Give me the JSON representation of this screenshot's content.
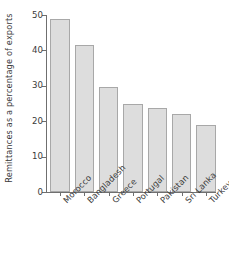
{
  "chart_data": {
    "type": "bar",
    "title": "",
    "subtitle": "",
    "xlabel": "",
    "ylabel": "Remittances as a percentage of exports",
    "categories": [
      "Morocco",
      "Bangladesh",
      "Greece",
      "Portugal",
      "Pakistan",
      "Sri Lanka",
      "Turkey"
    ],
    "values": [
      48.8,
      41.5,
      29.7,
      25.0,
      23.6,
      22.0,
      19.0
    ],
    "ylim": [
      0,
      50
    ],
    "yticks": [
      0,
      10,
      20,
      30,
      40,
      50
    ],
    "ytick_labels": [
      "0",
      "10",
      "20",
      "30",
      "40",
      "50"
    ],
    "grid": false,
    "legend": null,
    "legend_position": "none",
    "bar_fill_color": "#dddddd",
    "bar_edge_color": "#a8a8a8",
    "axis_color": "#6f6f6f",
    "background_color": "#ffffff",
    "text_color": "#3a3a3a",
    "xtick_label_rotation": -45
  }
}
